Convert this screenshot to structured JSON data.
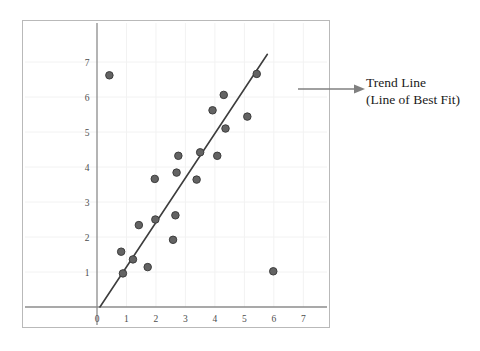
{
  "figure": {
    "background_color": "#ffffff",
    "frame_color": "#b9b9b9"
  },
  "annotation": {
    "name": "trend-line-callout",
    "line1": "Trend Line",
    "line2": "(Line of Best Fit)",
    "arrow_color": "#808080",
    "text_color": "#1a1a1a"
  },
  "chart_data": {
    "type": "scatter",
    "title": "",
    "xlabel": "",
    "ylabel": "",
    "xlim": [
      0,
      7.6
    ],
    "ylim": [
      0,
      7.6
    ],
    "xticks": [
      0,
      1,
      2,
      3,
      4,
      5,
      6,
      7
    ],
    "yticks": [
      0,
      1,
      2,
      3,
      4,
      5,
      6,
      7
    ],
    "xtick_labels": [
      "0",
      "1",
      "2",
      "3",
      "4",
      "5",
      "6",
      "7"
    ],
    "ytick_labels": [
      "0",
      "1",
      "2",
      "3",
      "4",
      "5",
      "6",
      "7"
    ],
    "grid": true,
    "grid_color": "#f2f2f2",
    "axis_color": "#8c8c8c",
    "tick_label_color": "#4d4d4d",
    "legend": null,
    "marker": {
      "color": "#636363",
      "edge_color": "#3d3d3d",
      "size": 7.5
    },
    "points": [
      {
        "x": 0.42,
        "y": 6.62
      },
      {
        "x": 0.82,
        "y": 1.58
      },
      {
        "x": 0.88,
        "y": 0.96
      },
      {
        "x": 1.22,
        "y": 1.36
      },
      {
        "x": 1.42,
        "y": 2.34
      },
      {
        "x": 1.72,
        "y": 1.14
      },
      {
        "x": 1.96,
        "y": 3.66
      },
      {
        "x": 1.98,
        "y": 2.5
      },
      {
        "x": 2.58,
        "y": 1.92
      },
      {
        "x": 2.66,
        "y": 2.62
      },
      {
        "x": 2.7,
        "y": 3.84
      },
      {
        "x": 2.76,
        "y": 4.32
      },
      {
        "x": 3.38,
        "y": 3.64
      },
      {
        "x": 3.5,
        "y": 4.42
      },
      {
        "x": 3.92,
        "y": 5.62
      },
      {
        "x": 4.08,
        "y": 4.32
      },
      {
        "x": 4.3,
        "y": 6.06
      },
      {
        "x": 4.36,
        "y": 5.1
      },
      {
        "x": 5.1,
        "y": 5.44
      },
      {
        "x": 5.42,
        "y": 6.66
      },
      {
        "x": 5.98,
        "y": 1.02
      }
    ],
    "trend_line": {
      "label": "Trend Line (Line of Best Fit)",
      "color": "#3d3d3d",
      "x_start": 0.1,
      "y_start": 0.0,
      "x_end": 5.78,
      "y_end": 7.22
    }
  }
}
